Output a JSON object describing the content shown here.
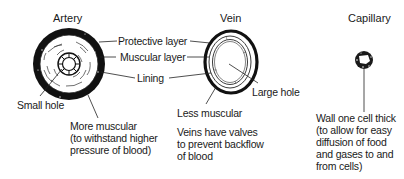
{
  "vessels": {
    "artery": {
      "title": "Artery",
      "labels": {
        "protective_layer": "Protective layer",
        "muscular_layer": "Muscular layer",
        "lining": "Lining",
        "small_hole": "Small hole"
      },
      "note": [
        "More muscular",
        "(to withstand higher",
        "pressure of blood)"
      ]
    },
    "vein": {
      "title": "Vein",
      "labels": {
        "large_hole": "Large hole",
        "less_muscular": "Less muscular"
      },
      "note": [
        "Veins have valves",
        "to prevent backflow",
        "of blood"
      ]
    },
    "capillary": {
      "title": "Capillary",
      "note": [
        "Wall one cell thick",
        "(to allow for easy",
        "diffusion of food",
        "and gases to and",
        "from cells)"
      ]
    }
  }
}
